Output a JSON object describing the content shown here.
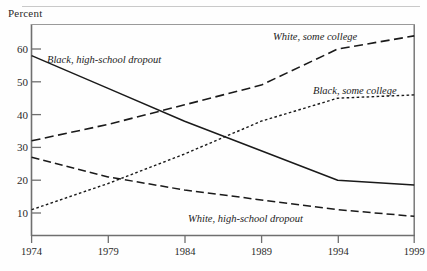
{
  "chart_data": {
    "type": "line",
    "title": "",
    "ylabel": "Percent",
    "xlabel": "",
    "x": [
      1974,
      1979,
      1984,
      1989,
      1994,
      1999
    ],
    "xlim": [
      1974,
      1999
    ],
    "ylim": [
      5,
      68
    ],
    "ytick_labels": [
      "10",
      "20",
      "30",
      "40",
      "50",
      "60"
    ],
    "ytick_values": [
      10,
      20,
      30,
      40,
      50,
      60
    ],
    "xtick_labels": [
      "1974",
      "1979",
      "1984",
      "1989",
      "1994",
      "1999"
    ],
    "grid": false,
    "legend_position": "inline-annotations",
    "series": [
      {
        "name": "Black, high-school dropout",
        "style": "solid",
        "values": [
          58,
          48,
          38,
          29,
          20,
          18.5
        ],
        "label_x": 1975.4,
        "label_y": 57.5
      },
      {
        "name": "White, some college",
        "style": "long-dash",
        "values": [
          32,
          37,
          43,
          49,
          60,
          64
        ],
        "label_x": 1991.0,
        "label_y": 65.5
      },
      {
        "name": "Black, some college",
        "style": "dotted",
        "values": [
          11,
          19,
          28,
          38,
          45,
          46
        ],
        "label_x": 1992.3,
        "label_y": 48.5
      },
      {
        "name": "White, high-school dropout",
        "style": "dashed",
        "values": [
          27,
          21,
          17,
          14,
          11,
          9
        ],
        "label_x": 1986.7,
        "label_y": 10.5
      }
    ]
  },
  "ytick_labels": {
    "t10": "10",
    "t20": "20",
    "t30": "30",
    "t40": "40",
    "t50": "50",
    "t60": "60"
  },
  "xtick_labels": {
    "t1974": "1974",
    "t1979": "1979",
    "t1984": "1984",
    "t1989": "1989",
    "t1994": "1994",
    "t1999": "1999"
  },
  "series_labels": {
    "s0": "Black, high-school dropout",
    "s1": "White, some college",
    "s2": "Black, some college",
    "s3": "White, high-school dropout"
  },
  "axis_title": "Percent",
  "colors": {
    "line": "#1a1a1a",
    "axis": "#6f6f6f",
    "text": "#2a2a2a",
    "rule": "#c9c9c9"
  }
}
